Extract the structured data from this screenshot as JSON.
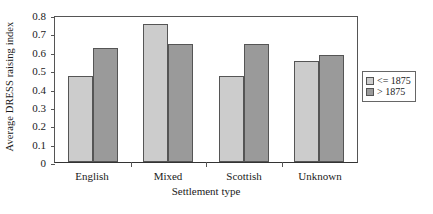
{
  "chart_data": {
    "type": "bar",
    "title": "",
    "xlabel": "Settlement type",
    "ylabel": "Average DRESS raising index",
    "categories": [
      "English",
      "Mixed",
      "Scottish",
      "Unknown"
    ],
    "series": [
      {
        "name": "<= 1875",
        "color": "#cccccc",
        "values": [
          0.47,
          0.75,
          0.47,
          0.55
        ]
      },
      {
        "name": "> 1875",
        "color": "#9a9a9a",
        "values": [
          0.62,
          0.64,
          0.64,
          0.58
        ]
      }
    ],
    "ylim": [
      0,
      0.8
    ],
    "ytick_values": [
      0,
      0.1,
      0.2,
      0.3,
      0.4,
      0.5,
      0.6,
      0.7,
      0.8
    ],
    "ytick_labels": [
      "0",
      "0.1",
      "0.2",
      "0.3",
      "0.4",
      "0.5",
      "0.6",
      "0.7",
      "0.8"
    ],
    "grid": false,
    "legend_position": "right"
  },
  "legend": {
    "entries": [
      {
        "label": "<= 1875"
      },
      {
        "label": "> 1875"
      }
    ]
  },
  "caption": {
    "text": ""
  }
}
